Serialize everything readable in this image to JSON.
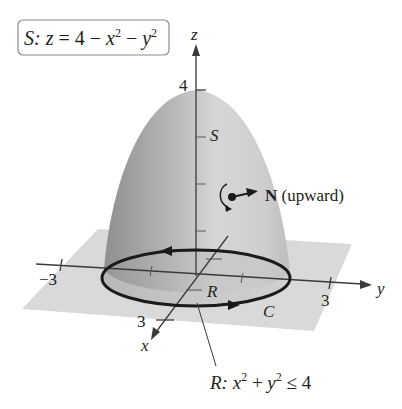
{
  "diagram": {
    "surface_label": {
      "prefix": "S:",
      "eq_z": "z",
      "eq_rest": " = 4 − ",
      "x": "x",
      "exp1": "2",
      "minus": " − ",
      "y": "y",
      "exp2": "2"
    },
    "axes": {
      "z_label": "z",
      "y_label": "y",
      "x_label": "x",
      "z_tick_label": "4",
      "y_neg_tick_label": "−3",
      "y_pos_tick_label": "3",
      "x_tick_label": "3"
    },
    "surface_marker": "S",
    "normal": {
      "bold": "N",
      "text": " (upward)"
    },
    "region_marker": "R",
    "curve_marker": "C",
    "region_label": {
      "prefix": "R:",
      "x": "x",
      "exp1": "2",
      "plus": " + ",
      "y": "y",
      "exp2": "2",
      "rest": " ≤ 4"
    },
    "colors": {
      "plane": "#d9d9d9",
      "surface_light": "#e6e6e6",
      "surface_dark": "#9a9a9a",
      "ink": "#231f20"
    }
  }
}
